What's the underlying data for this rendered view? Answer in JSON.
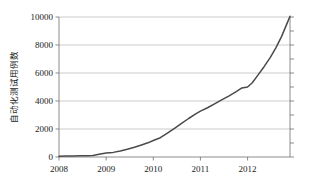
{
  "chart_data": {
    "type": "line",
    "title": "",
    "subtitle": "",
    "xlabel": "",
    "ylabel": "自动化测试用例数",
    "xlim": [
      2008.0,
      2012.9
    ],
    "ylim": [
      0,
      10000
    ],
    "grid": true,
    "legend": null,
    "legend_position": "none",
    "line_color": "#4a4a4a",
    "grid_color": "#a8a8a8",
    "axis_color": "#6e6e6e",
    "x_tick_labels": [
      "2008",
      "2009",
      "2010",
      "2011",
      "2012"
    ],
    "x_tick_values": [
      2008,
      2009,
      2010,
      2011,
      2012
    ],
    "y_tick_labels": [
      "0",
      "2000",
      "4000",
      "6000",
      "8000",
      "10000"
    ],
    "y_tick_values": [
      0,
      2000,
      4000,
      6000,
      8000,
      10000
    ],
    "series": [
      {
        "name": "自动化测试用例数",
        "x": [
          2008.0,
          2008.15,
          2008.3,
          2008.45,
          2008.6,
          2008.72,
          2008.85,
          2009.0,
          2009.15,
          2009.3,
          2009.45,
          2009.6,
          2009.75,
          2009.9,
          2010.0,
          2010.15,
          2010.3,
          2010.45,
          2010.6,
          2010.75,
          2010.9,
          2011.0,
          2011.15,
          2011.3,
          2011.45,
          2011.6,
          2011.75,
          2011.88,
          2012.0,
          2012.1,
          2012.22,
          2012.35,
          2012.48,
          2012.6,
          2012.72,
          2012.82,
          2012.9
        ],
        "y": [
          60,
          70,
          80,
          90,
          95,
          110,
          200,
          280,
          330,
          430,
          560,
          700,
          860,
          1030,
          1180,
          1380,
          1700,
          2050,
          2400,
          2750,
          3080,
          3280,
          3520,
          3800,
          4080,
          4350,
          4650,
          4930,
          5000,
          5300,
          5850,
          6450,
          7100,
          7800,
          8600,
          9400,
          10050
        ]
      }
    ]
  },
  "plot_geometry": {
    "left": 59,
    "right": 290,
    "top": 17,
    "bottom": 157
  }
}
